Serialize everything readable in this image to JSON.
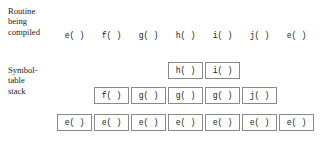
{
  "figure": {
    "type": "compiler-symbol-table-stack-diagram",
    "background_color": "#ffffff",
    "box_border_color": "#8a8a8a",
    "text_color": "#1a1a1a"
  },
  "labels": {
    "routine_being_compiled": "Routine\nbeing\ncompiled",
    "symbol_table_stack": "Symbol-\ntable\nstack"
  },
  "header": {
    "routines": [
      "e( )",
      "f( )",
      "g( )",
      "h( )",
      "i( )",
      "j( )",
      "e( )"
    ]
  },
  "stack_states": [
    {
      "routine": "e( )",
      "boxes": [
        "e( )"
      ]
    },
    {
      "routine": "f( )",
      "boxes": [
        "f( )",
        "e( )"
      ]
    },
    {
      "routine": "g( )",
      "boxes": [
        "g( )",
        "e( )"
      ]
    },
    {
      "routine": "h( )",
      "boxes": [
        "h( )",
        "g( )",
        "e( )"
      ]
    },
    {
      "routine": "i( )",
      "boxes": [
        "i( )",
        "g( )",
        "e( )"
      ]
    },
    {
      "routine": "j( )",
      "boxes": [
        "j( )",
        "e( )"
      ]
    },
    {
      "routine": "e( )",
      "boxes": [
        "e( )"
      ]
    }
  ],
  "geometry": {
    "column_x": [
      57,
      94,
      131,
      168,
      205,
      242,
      279
    ],
    "row_y_top": 62,
    "row_y_middle": 87,
    "row_y_bottom": 114,
    "box_width": 35,
    "box_height": 17,
    "header_y": 30
  }
}
